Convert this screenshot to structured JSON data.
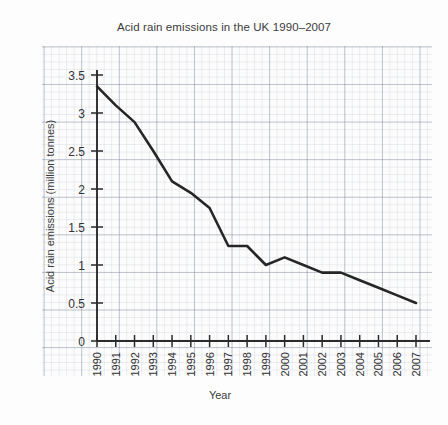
{
  "chart_data": {
    "type": "line",
    "title": "Acid rain emissions in the UK 1990–2007",
    "xlabel": "Year",
    "ylabel": "Acid rain emissions (million tonnes)",
    "grid": "graph-paper",
    "legend": "none",
    "xlim": [
      1990,
      2007
    ],
    "ylim": [
      0,
      3.5
    ],
    "ytick_labels": [
      "3.5",
      "3",
      "2.5",
      "2",
      "1.5",
      "1",
      "0.5",
      "0"
    ],
    "ytick_values": [
      3.5,
      3,
      2.5,
      2,
      1.5,
      1,
      0.5,
      0
    ],
    "categories": [
      "1990",
      "1991",
      "1992",
      "1993",
      "1994",
      "1995",
      "1996",
      "1997",
      "1998",
      "1999",
      "2000",
      "2001",
      "2002",
      "2003",
      "2004",
      "2005",
      "2006",
      "2007"
    ],
    "values": [
      3.35,
      3.1,
      2.88,
      2.5,
      2.1,
      1.95,
      1.75,
      1.25,
      1.25,
      1.0,
      1.1,
      1.0,
      0.9,
      0.9,
      0.8,
      0.7,
      0.6,
      0.5
    ],
    "series": [
      {
        "name": "Acid rain emissions",
        "values": [
          3.35,
          3.1,
          2.88,
          2.5,
          2.1,
          1.95,
          1.75,
          1.25,
          1.25,
          1.0,
          1.1,
          1.0,
          0.9,
          0.9,
          0.8,
          0.7,
          0.6,
          0.5
        ]
      }
    ],
    "line_color": "#262626"
  }
}
